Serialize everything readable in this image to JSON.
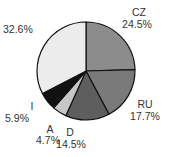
{
  "chart_data": {
    "type": "pie",
    "title": "",
    "categories": [
      "CZ",
      "RU",
      "D",
      "A",
      "I",
      ""
    ],
    "values": [
      24.5,
      17.7,
      14.5,
      4.7,
      5.9,
      32.6
    ],
    "value_labels": [
      "24.5%",
      "17.7%",
      "14.5%",
      "4.7%",
      "5.9%",
      "32.6%"
    ],
    "colors": [
      "#8c8c8c",
      "#7a7a7a",
      "#5e5e5e",
      "#c6c6c6",
      "#111111",
      "#ececec"
    ],
    "start_angle": "12 o'clock",
    "direction": "clockwise",
    "legend": "none (direct labels)"
  },
  "labels": {
    "cz_name": "CZ",
    "cz_value": "24.5%",
    "ru_name": "RU",
    "ru_value": "17.7%",
    "d_name": "D",
    "d_value": "14.5%",
    "a_name": "A",
    "a_value": "4.7%",
    "i_name": "I",
    "i_value": "5.9%",
    "other_value": "32.6%"
  }
}
